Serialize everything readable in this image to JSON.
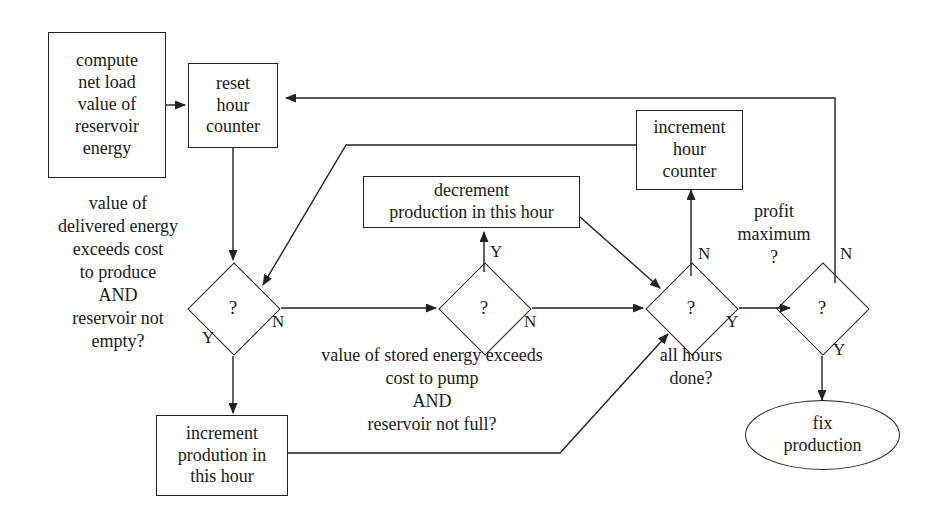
{
  "diagram": {
    "stroke_color": "#222222",
    "text_color": "#1a1a1a",
    "background_color": "#ffffff"
  },
  "nodes": {
    "compute_net_load": {
      "text": "compute\nnet load\nvalue of\nreservoir\nenergy",
      "shape": "process"
    },
    "reset_hour_counter": {
      "text": "reset\nhour\ncounter",
      "shape": "process"
    },
    "decrement_production": {
      "text": "decrement\nproduction in this hour",
      "shape": "process"
    },
    "increment_hour_counter": {
      "text": "increment\nhour\ncounter",
      "shape": "process"
    },
    "increment_production": {
      "text": "increment\nprodution in\nthis hour",
      "shape": "process"
    },
    "fix_production": {
      "text": "fix\nproduction",
      "shape": "terminal"
    },
    "decision_delivered": {
      "text": "?",
      "shape": "decision"
    },
    "decision_stored": {
      "text": "?",
      "shape": "decision"
    },
    "decision_all_hours": {
      "text": "?",
      "shape": "decision"
    },
    "decision_profit": {
      "text": "?",
      "shape": "decision"
    }
  },
  "annotations": {
    "delivered_condition": "value of\ndelivered energy\nexceeds cost\nto produce\nAND\nreservoir not\nempty?",
    "stored_condition": "value of stored energy exceeds\ncost to pump\nAND\nreservoir not full?",
    "all_hours_condition": "all hours\ndone?",
    "profit_condition": "profit\nmaximum\n?"
  },
  "edge_labels": {
    "delivered_yes": "Y",
    "delivered_no": "N",
    "stored_yes": "Y",
    "stored_no": "N",
    "all_hours_no": "N",
    "all_hours_yes": "Y",
    "profit_no": "N",
    "profit_yes": "Y"
  }
}
